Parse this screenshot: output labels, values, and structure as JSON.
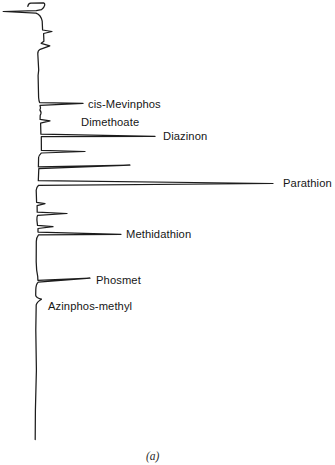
{
  "figure": {
    "kind": "gas chromatogram of organophosphorus pesticides",
    "caption": "(a)",
    "caption_x": 146,
    "caption_y": 460,
    "ink_color": "#1c1c1c",
    "background": "#ffffff"
  },
  "chart_data": {
    "type": "line",
    "chart_kind": "chromatogram trace",
    "title": "",
    "xlabel": "",
    "ylabel": "",
    "axes_shown": false,
    "grid": false,
    "orientation": "time axis vertical (increasing downward), detector response horizontal (increasing rightward), no scales or tick labels shown",
    "solvent_front": {
      "description": "large off-scale injection/solvent response block at top of trace",
      "y_range_px": [
        0,
        53
      ],
      "max_extent_x_px": 52
    },
    "labeled_peaks": [
      {
        "label": "cis-Mevinphos",
        "peak_y_px": 104,
        "peak_tip_x_px": 83,
        "label_x": 88,
        "label_y": 108
      },
      {
        "label": "Dimethoate",
        "peak_y_px": 122,
        "peak_tip_x_px": 50,
        "label_x": 81,
        "label_y": 126
      },
      {
        "label": "Diazinon",
        "peak_y_px": 135,
        "peak_tip_x_px": 155,
        "label_x": 163,
        "label_y": 140
      },
      {
        "label": "Parathion",
        "peak_y_px": 183,
        "peak_tip_x_px": 273,
        "label_x": 283,
        "label_y": 187
      },
      {
        "label": "Methidathion",
        "peak_y_px": 233,
        "peak_tip_x_px": 121,
        "label_x": 126,
        "label_y": 238
      },
      {
        "label": "Phosmet",
        "peak_y_px": 280,
        "peak_tip_x_px": 90,
        "label_x": 96,
        "label_y": 284
      },
      {
        "label": "Azinphos-methyl",
        "peak_y_px": 301,
        "peak_tip_x_px": 42,
        "label_x": 48,
        "label_y": 310
      }
    ],
    "unlabeled_peaks": [
      {
        "peak_y_px": 32,
        "peak_tip_x_px": 52
      },
      {
        "peak_y_px": 46,
        "peak_tip_x_px": 50
      },
      {
        "peak_y_px": 152,
        "peak_tip_x_px": 85
      },
      {
        "peak_y_px": 166,
        "peak_tip_x_px": 130
      },
      {
        "peak_y_px": 203,
        "peak_tip_x_px": 45
      },
      {
        "peak_y_px": 213,
        "peak_tip_x_px": 67
      },
      {
        "peak_y_px": 227,
        "peak_tip_x_px": 53
      }
    ],
    "baseline_x_px": 37,
    "trace_end_y_px": 440,
    "trace_path": "M 27.8 6.3 C 28.1 4.4 28.9 3.3 30.8 3.1 L 43.6 2.9 C 45.4 3.2 45.3 7 41.4 9.7 L 36.3 10.7 L 3.2 11.5 L 36 13.1 C 39.7 14.4 41.5 17.6 42.2 21.2 L 42.6 30 L 52 31.5 L 43.6 33.5 L 43.9 41.2 L 41.2 43.3 L 49.8 45.8 L 40.2 49.3 C 38.3 50.3 37.7 51.7 37.8 53.8 L 38.7 70 L 38.1 75.5 L 38.6 97.5 C 38.8 99.8 39.1 101.5 39.6 102.6 L 83 103.4 L 40 105.4 C 40.7 107 40.7 108.6 39.9 110 C 41.2 111.6 41.4 113.5 40.2 115.3 L 40.1 119.4 L 50 120.9 L 40.6 123.1 L 40.9 134.2 L 155 136.4 L 41.3 136.7 L 41.4 150.4 L 85 151.5 L 41.4 153 C 40.2 154.2 38.9 155.4 38.6 157.5 L 38.4 166.9 L 130 165.1 L 38.8 168.7 L 38.3 180.7 L 273 183.5 L 38.6 185.3 C 37.2 186.5 36.4 188 36.2 190.3 L 36.6 202.3 L 45 203.7 L 37.1 205.7 L 37.2 212.2 L 67 213.5 L 37.6 215.3 C 37 216.5 36.8 218 36.9 220 L 37.5 225.4 L 53 226.7 L 38 228.5 L 38 232.1 L 121 234.3 L 38.5 234.8 C 37 236.6 36.4 238.8 36.3 241.5 L 36.2 262 C 36.3 268 36.8 272.5 37.7 276.3 L 37.9 280.3 L 90 278.2 L 38.2 282.1 C 36.6 283.6 35.9 286 35.8 289.5 L 35.7 295.3 C 36.1 297.2 38.3 298.4 41.5 299.2 C 38.7 300.8 36.7 302.7 36.2 304.9 L 35.8 330 L 36.4 370 L 35.4 410 L 35.2 439.5"
  }
}
